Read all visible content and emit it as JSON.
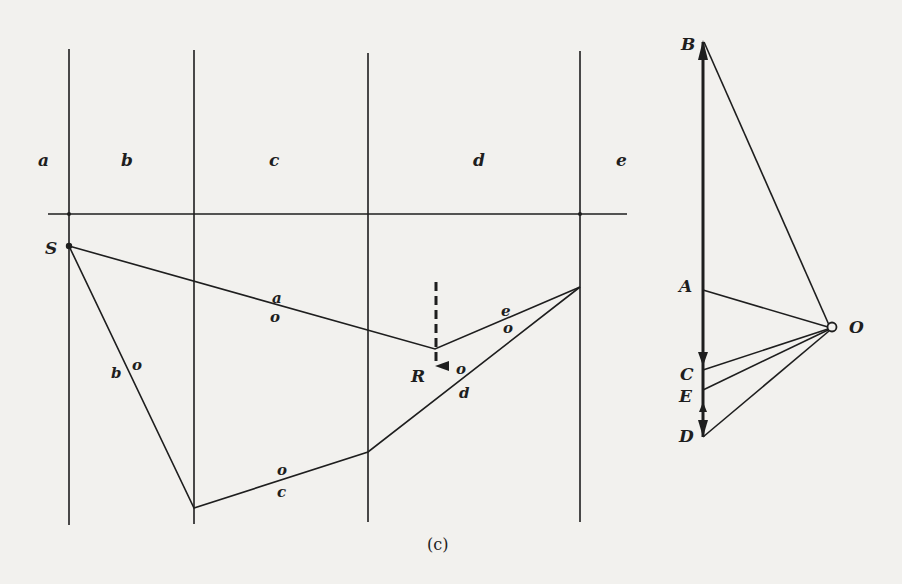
{
  "figure": {
    "caption": "(c)",
    "colors": {
      "ink": "#1e1e1e",
      "paper": "#f2f1ee"
    },
    "space_diagram": {
      "space_labels": [
        "a",
        "b",
        "c",
        "d",
        "e"
      ],
      "point_labels": {
        "S": "S",
        "R": "R"
      },
      "ray_labels": {
        "a_top": "a",
        "a_bottom": "o",
        "b_left": "b",
        "b_right": "o",
        "c_top": "o",
        "c_bottom": "c",
        "d_top": "o",
        "d_bottom": "d",
        "e_top": "e",
        "e_bottom": "o"
      },
      "resultant": {
        "label": "R",
        "style": "dashed arrow downward"
      }
    },
    "force_polygon": {
      "points": [
        "B",
        "A",
        "C",
        "E",
        "D"
      ],
      "pole": "O"
    }
  }
}
